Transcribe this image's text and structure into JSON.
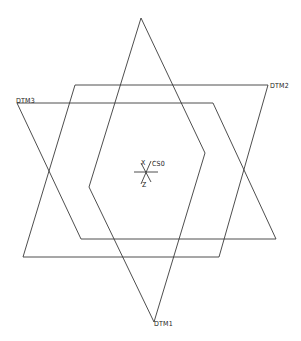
{
  "diagram": {
    "background": "#ffffff",
    "line_color": "#3a3a3a",
    "planes": [
      {
        "name": "DTM1",
        "label": "DTM1",
        "points": "141,18 205,153 154,322 89,187",
        "label_pos": [
          156,
          325
        ]
      },
      {
        "name": "DTM2",
        "label": "DTM2",
        "points": "75,85 268,85 219,257 23,257",
        "label_pos": [
          270,
          87
        ]
      },
      {
        "name": "DTM3",
        "label": "DTM3",
        "points": "17,103 213,103 276,239 81,239",
        "label_pos": [
          16,
          105
        ]
      }
    ],
    "csys": {
      "name": "CS0",
      "label": "CS0",
      "axis_x_label": "X",
      "axis_z_label": "Z",
      "origin": [
        146,
        172
      ]
    }
  }
}
